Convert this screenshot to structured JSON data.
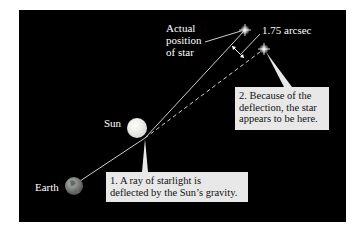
{
  "diagram": {
    "labels": {
      "actual_position": [
        "Actual",
        "position",
        "of star"
      ],
      "arcsec": "1.75 arcsec",
      "sun": "Sun",
      "earth": "Earth"
    },
    "callouts": {
      "box1": [
        "1. A ray of starlight is",
        "deflected by the Sun’s gravity."
      ],
      "box2": [
        "2. Because of the",
        "deflection, the star",
        "appears to be here."
      ]
    },
    "colors": {
      "background": "#000000",
      "callout_fill": "#e8e8e8",
      "ray": "#cfcfcf",
      "sun": "#f2f2ee",
      "earth": "#8a8a8a"
    }
  }
}
